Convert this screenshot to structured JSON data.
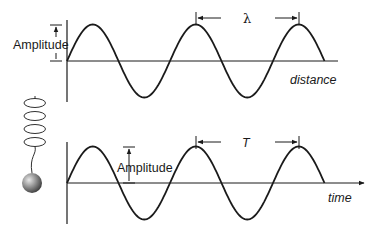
{
  "diagram": {
    "top_panel": {
      "amplitude_label": "Amplitude",
      "wavelength_symbol": "λ",
      "axis_label": "distance",
      "cycles_shown": 2.5
    },
    "bottom_panel": {
      "amplitude_label": "Amplitude",
      "period_symbol": "T",
      "axis_label": "time",
      "cycles_shown": 2.5
    },
    "spring_mass": {
      "coils": 4,
      "icon": "spring-mass-icon"
    },
    "colors": {
      "line": "#1a1a1a",
      "ball_light": "#d9d9d9",
      "ball_dark": "#4a4a4a"
    }
  }
}
